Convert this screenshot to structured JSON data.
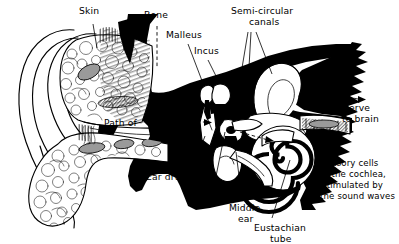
{
  "figure": {
    "background_color": "#ffffff",
    "ink_color": "#000000",
    "style": "black-and-white line engraving"
  },
  "labels": {
    "skin": "Skin",
    "bone": "Bone",
    "malleus": "Malleus",
    "incus": "Incus",
    "semicircular_line1": "Semi-circular",
    "semicircular_line2": "canals",
    "nerve_line1": "Nerve",
    "nerve_line2": "to brain",
    "path_of": "Path of",
    "sound": "Sound",
    "waves": "waves",
    "ear_drum": "Ear drum",
    "stapes": "Stapes",
    "middle_line1": "Middle",
    "middle_line2": "ear",
    "eustachian_line1": "Eustachian",
    "eustachian_line2": "tube",
    "sensory_line1": "Sensory cells",
    "sensory_line2": "of the cochlea,",
    "sensory_line3": "stimulated by",
    "sensory_line4": "the sound waves"
  },
  "parts": {
    "pinna": "outer-ear-pinna",
    "ear_lobe": "ear-lobe",
    "ear_canal": "ear-canal",
    "temporal_bone": "temporal-bone-mass",
    "cochlea": "cochlea-spiral",
    "semicircular_canals": "semi-circular-canals",
    "ossicles": "ossicle-chain",
    "eardrum_membrane": "tympanic-membrane",
    "eustachian_tube": "eustachian-tube",
    "auditory_nerve": "auditory-nerve"
  }
}
